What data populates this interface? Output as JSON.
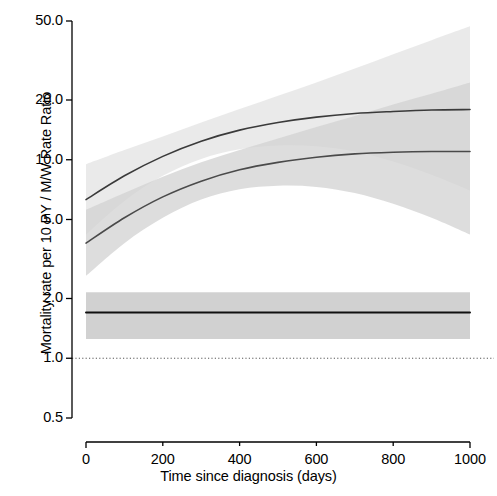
{
  "chart_data": {
    "type": "line",
    "title": "",
    "subtitle": "",
    "xlabel": "Time since diagnosis (days)",
    "ylabel": "Mortality rate per 10 PY / M/W Rate Ratio",
    "xlim": [
      0,
      1000
    ],
    "ylim": [
      0.5,
      50.0
    ],
    "yscale": "log",
    "xscale": "linear",
    "grid": false,
    "legend": null,
    "xticks": [
      0,
      200,
      400,
      600,
      800,
      1000
    ],
    "xticklabels": [
      "0",
      "200",
      "400",
      "600",
      "800",
      "1000"
    ],
    "yticks": [
      0.5,
      1.0,
      2.0,
      5.0,
      10.0,
      20.0,
      50.0
    ],
    "yticklabels": [
      "0.5",
      "1.0",
      "2.0",
      "5.0",
      "10.0",
      "20.0",
      "50.0"
    ],
    "reference_line": {
      "name": "null-ratio-reference",
      "y": 1.0,
      "style": "dotted",
      "color": "#555555"
    },
    "x": [
      0,
      100,
      200,
      300,
      400,
      500,
      600,
      700,
      800,
      900,
      1000
    ],
    "series": [
      {
        "name": "Men mortality rate per 10 PY",
        "role": "men-rate-curve",
        "color": "#3a3a3a",
        "linewidth": 1.6,
        "values": [
          6.3,
          8.3,
          10.4,
          12.4,
          14.1,
          15.4,
          16.4,
          17.1,
          17.5,
          17.8,
          17.9
        ],
        "band": {
          "name": "men-rate-95ci",
          "fill": "#e3e3e3",
          "alpha": 0.75,
          "lower": [
            4.2,
            6.2,
            8.3,
            10.1,
            11.3,
            11.8,
            11.7,
            11.0,
            9.8,
            8.4,
            7.0
          ],
          "upper": [
            9.5,
            11.2,
            13.1,
            15.4,
            18.0,
            21.0,
            24.5,
            28.8,
            34.0,
            40.0,
            47.0
          ]
        }
      },
      {
        "name": "Women mortality rate per 10 PY",
        "role": "women-rate-curve",
        "color": "#4a4a4a",
        "linewidth": 1.6,
        "values": [
          3.8,
          5.1,
          6.5,
          7.8,
          8.9,
          9.7,
          10.3,
          10.7,
          10.9,
          11.0,
          11.0
        ],
        "band": {
          "name": "women-rate-95ci",
          "fill": "#d2d2d2",
          "alpha": 0.75,
          "lower": [
            2.6,
            3.8,
            5.1,
            6.3,
            7.1,
            7.4,
            7.3,
            6.8,
            6.0,
            5.1,
            4.2
          ],
          "upper": [
            5.6,
            6.8,
            8.2,
            9.7,
            11.2,
            12.8,
            14.6,
            16.6,
            19.0,
            21.5,
            24.5
          ]
        }
      },
      {
        "name": "M/W Rate Ratio",
        "role": "rate-ratio-line",
        "color": "#101010",
        "linewidth": 2.0,
        "values": [
          1.7,
          1.7,
          1.7,
          1.7,
          1.7,
          1.7,
          1.7,
          1.7,
          1.7,
          1.7,
          1.7
        ],
        "band": {
          "name": "rate-ratio-95ci",
          "fill": "#cccccc",
          "alpha": 0.9,
          "lower": [
            1.25,
            1.25,
            1.25,
            1.25,
            1.25,
            1.25,
            1.25,
            1.25,
            1.25,
            1.25,
            1.25
          ],
          "upper": [
            2.15,
            2.15,
            2.15,
            2.15,
            2.15,
            2.15,
            2.15,
            2.15,
            2.15,
            2.15,
            2.15
          ]
        }
      }
    ]
  }
}
